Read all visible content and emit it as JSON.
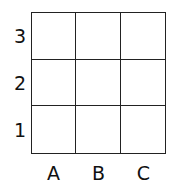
{
  "grid": {
    "rows": 3,
    "cols": 3,
    "row_labels": [
      "3",
      "2",
      "1"
    ],
    "col_labels": [
      "A",
      "B",
      "C"
    ],
    "line_color": "#222222",
    "background": "#ffffff"
  }
}
